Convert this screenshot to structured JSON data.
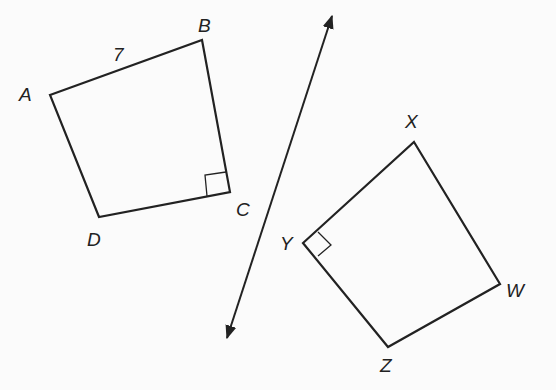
{
  "figure": {
    "quad1": {
      "vertices": {
        "A": "A",
        "B": "B",
        "C": "C",
        "D": "D"
      },
      "side_label": "7",
      "right_angle_at": "C"
    },
    "quad2": {
      "vertices": {
        "X": "X",
        "Y": "Y",
        "Z": "Z",
        "W": "W"
      },
      "right_angle_at": "Y"
    },
    "line": "line of reflection with arrows at both ends"
  }
}
